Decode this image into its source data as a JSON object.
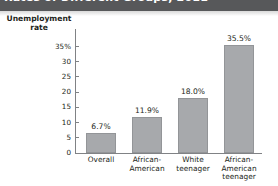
{
  "banner": {
    "title": "Rates of Different Groups, 2011"
  },
  "chart_data": {
    "type": "bar",
    "title": "Rates of Different Groups, 2011",
    "xlabel": "",
    "ylabel": "Unemployment rate",
    "ylabel_line1": "Unemployment",
    "ylabel_line2": "rate",
    "categories": [
      "Overall",
      "African-American",
      "White teenager",
      "African-American teenager"
    ],
    "category_lines": [
      [
        "Overall"
      ],
      [
        "African-",
        "American"
      ],
      [
        "White",
        "teenager"
      ],
      [
        "African-",
        "American",
        "teenager"
      ]
    ],
    "values": [
      6.7,
      11.9,
      18.0,
      35.5
    ],
    "value_labels": [
      "6.7%",
      "11.9%",
      "18.0%",
      "35.5%"
    ],
    "yticks": [
      0,
      5,
      10,
      15,
      20,
      25,
      30,
      35
    ],
    "ytick_labels": [
      "0",
      "5",
      "10",
      "15",
      "20",
      "25",
      "30",
      "35%"
    ],
    "ylim": [
      0,
      35
    ],
    "grid": false,
    "legend": null,
    "bar_color": "#a7a9ac",
    "axis_color": "#808285",
    "text_color": "#231f20",
    "banner_color": "#57585a"
  }
}
